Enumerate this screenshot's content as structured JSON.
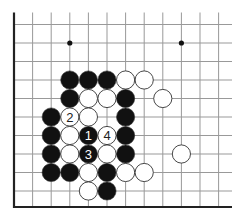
{
  "diagram": {
    "type": "go-board-fragment",
    "grid": {
      "x0": 14,
      "dx": 18.6,
      "cols": 12,
      "y0": 24.5,
      "dy": 18.5,
      "rows": 10,
      "right_extent": 232,
      "bottom_edge_y": 207,
      "line_color": "#999999",
      "edge_color": "#222222"
    },
    "hoshi": [
      {
        "col": 3,
        "row": 1
      },
      {
        "col": 9,
        "row": 1
      }
    ],
    "stones": [
      {
        "color": "black",
        "col": 3,
        "row": 3
      },
      {
        "color": "black",
        "col": 4,
        "row": 3
      },
      {
        "color": "black",
        "col": 5,
        "row": 3
      },
      {
        "color": "white",
        "col": 6,
        "row": 3
      },
      {
        "color": "white",
        "col": 7,
        "row": 3
      },
      {
        "color": "black",
        "col": 3,
        "row": 4
      },
      {
        "color": "white",
        "col": 4,
        "row": 4
      },
      {
        "color": "white",
        "col": 5,
        "row": 4
      },
      {
        "color": "black",
        "col": 6,
        "row": 4
      },
      {
        "color": "white",
        "col": 8,
        "row": 4
      },
      {
        "color": "black",
        "col": 2,
        "row": 5
      },
      {
        "color": "white",
        "col": 3,
        "row": 5,
        "label": "2"
      },
      {
        "color": "white",
        "col": 4,
        "row": 5
      },
      {
        "color": "black",
        "col": 6,
        "row": 5
      },
      {
        "color": "black",
        "col": 2,
        "row": 6
      },
      {
        "color": "white",
        "col": 3,
        "row": 6
      },
      {
        "color": "black",
        "col": 4,
        "row": 6,
        "label": "1"
      },
      {
        "color": "white",
        "col": 5,
        "row": 6,
        "label": "4"
      },
      {
        "color": "black",
        "col": 6,
        "row": 6
      },
      {
        "color": "black",
        "col": 2,
        "row": 7
      },
      {
        "color": "white",
        "col": 3,
        "row": 7
      },
      {
        "color": "black",
        "col": 4,
        "row": 7,
        "label": "3"
      },
      {
        "color": "white",
        "col": 5,
        "row": 7
      },
      {
        "color": "black",
        "col": 6,
        "row": 7
      },
      {
        "color": "white",
        "col": 9,
        "row": 7
      },
      {
        "color": "black",
        "col": 2,
        "row": 8
      },
      {
        "color": "black",
        "col": 3,
        "row": 8
      },
      {
        "color": "white",
        "col": 4,
        "row": 8
      },
      {
        "color": "black",
        "col": 5,
        "row": 8
      },
      {
        "color": "white",
        "col": 6,
        "row": 8
      },
      {
        "color": "white",
        "col": 7,
        "row": 8
      },
      {
        "color": "white",
        "col": 4,
        "row": 9
      },
      {
        "color": "black",
        "col": 5,
        "row": 9
      }
    ],
    "colors": {
      "black_stone": "#111111",
      "white_stone": "#ffffff",
      "stone_outline": "#333333",
      "label_on_black": "#ffffff",
      "label_on_white": "#222222"
    }
  }
}
